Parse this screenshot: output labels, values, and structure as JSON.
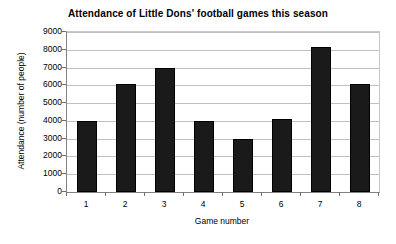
{
  "chart_data": {
    "type": "bar",
    "title": "Attendance of Little Dons' football games this season",
    "xlabel": "Game number",
    "ylabel": "Attendance (number of people)",
    "categories": [
      "1",
      "2",
      "3",
      "4",
      "5",
      "6",
      "7",
      "8"
    ],
    "values": [
      4000,
      6050,
      6950,
      4000,
      3000,
      4100,
      8150,
      6100
    ],
    "ylim": [
      0,
      9000
    ],
    "ytick_labels": [
      "9000",
      "8000",
      "7000",
      "6000",
      "5000",
      "4000",
      "3000",
      "2000",
      "1000",
      "0"
    ],
    "ytick_values": [
      9000,
      8000,
      7000,
      6000,
      5000,
      4000,
      3000,
      2000,
      1000,
      0
    ],
    "ytick_step": 1000,
    "grid": true,
    "legend": false,
    "bar_color": "#1a1a1a",
    "grid_color": "#c0c0c0",
    "axis_color": "#808080",
    "background": "#ffffff"
  }
}
